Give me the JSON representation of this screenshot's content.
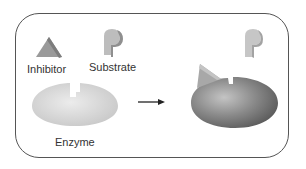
{
  "diagram": {
    "labels": {
      "inhibitor": "Inhibitor",
      "substrate": "Substrate",
      "enzyme": "Enzyme"
    },
    "icons": {
      "arrow": "right-arrow",
      "inhibitor": "triangle",
      "substrate": "p-shape-block",
      "enzyme": "notched-ellipse"
    },
    "colors": {
      "frame": "#555555",
      "enzyme_free": "#d9d9d9",
      "enzyme_bound": "#7a7a7a",
      "inhibitor": "#a6a6a6",
      "substrate": "#c8c8c8",
      "text": "#333333"
    }
  }
}
